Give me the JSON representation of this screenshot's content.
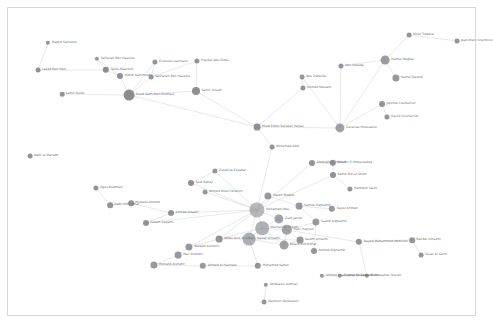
{
  "figure": {
    "kind": "network-graph",
    "title": "",
    "background": "#ffffff",
    "border_color": "#d8d8d8",
    "node_color": "#7d7f84",
    "edge_color": "#d5d5d7",
    "label_color": "#6d6f73"
  },
  "chart_data": {
    "type": "scatter",
    "title": "",
    "xlabel": "",
    "ylabel": "",
    "grid": false,
    "legend": "none",
    "layout": "force-directed",
    "node_count": 62,
    "edge_count": 75,
    "nodes": [
      {
        "id": "n0",
        "label": "Madjid Sahoune",
        "x": 48,
        "y": 43,
        "r": 2.2,
        "side": "r",
        "o": 0.82
      },
      {
        "id": "n1",
        "label": "Lased Ben Heni",
        "x": 38,
        "y": 70,
        "r": 2.4,
        "side": "r",
        "o": 0.85
      },
      {
        "id": "n2",
        "label": "Tarek Maaroufi",
        "x": 106,
        "y": 70,
        "r": 3.2,
        "side": "r",
        "o": 0.88
      },
      {
        "id": "n3",
        "label": "Seifallah Ben Hassine",
        "x": 97,
        "y": 59,
        "r": 2.2,
        "side": "r",
        "o": 0.8
      },
      {
        "id": "n4",
        "label": "Mehdi Kammoun",
        "x": 120,
        "y": 76,
        "r": 3.0,
        "side": "r",
        "o": 0.85
      },
      {
        "id": "n5",
        "label": "Samir Kishk",
        "x": 62,
        "y": 94,
        "r": 2.3,
        "side": "r",
        "o": 0.82
      },
      {
        "id": "n6",
        "label": "Essid Sami Ben Khemais",
        "x": 129,
        "y": 95,
        "r": 5.4,
        "side": "r",
        "o": 0.9
      },
      {
        "id": "n7",
        "label": "Essoussi Laaroussi",
        "x": 155,
        "y": 62,
        "r": 2.6,
        "side": "r",
        "o": 0.82
      },
      {
        "id": "n8",
        "label": "Sadfallah Ben Hassine",
        "x": 151,
        "y": 77,
        "r": 2.4,
        "side": "r",
        "o": 0.82
      },
      {
        "id": "n9",
        "label": "Haydar Abu Doha",
        "x": 197,
        "y": 61,
        "r": 2.6,
        "side": "r",
        "o": 0.84
      },
      {
        "id": "n10",
        "label": "Samir Yousef",
        "x": 196,
        "y": 91,
        "r": 4.0,
        "side": "r",
        "o": 0.86
      },
      {
        "id": "n11",
        "label": "Nabil al-Marabh",
        "x": 30,
        "y": 156,
        "r": 2.4,
        "side": "r",
        "o": 0.84
      },
      {
        "id": "n12",
        "label": "Imad Eddin Barakat Yarkas",
        "x": 257,
        "y": 127,
        "r": 3.4,
        "side": "r",
        "o": 0.86
      },
      {
        "id": "n13",
        "label": "Mohamed Abdi",
        "x": 272,
        "y": 147,
        "r": 2.4,
        "side": "r",
        "o": 0.82
      },
      {
        "id": "n14",
        "label": "Abdelghani Mzoudi",
        "x": 312,
        "y": 163,
        "r": 3.0,
        "side": "r",
        "o": 0.84
      },
      {
        "id": "n15",
        "label": "Mounir El Motassadeq",
        "x": 333,
        "y": 163,
        "r": 3.2,
        "side": "r",
        "o": 0.86
      },
      {
        "id": "n16",
        "label": "Ramzi Bin al-Shibh",
        "x": 333,
        "y": 175,
        "r": 3.0,
        "side": "r",
        "o": 0.85
      },
      {
        "id": "n17",
        "label": "Mamduh Salim",
        "x": 350,
        "y": 189,
        "r": 2.6,
        "side": "r",
        "o": 0.82
      },
      {
        "id": "n18",
        "label": "Agus Budiman",
        "x": 96,
        "y": 188,
        "r": 2.6,
        "side": "r",
        "o": 0.84
      },
      {
        "id": "n19",
        "label": "Said Bahaji",
        "x": 191,
        "y": 183,
        "r": 3.0,
        "side": "r",
        "o": 0.85
      },
      {
        "id": "n20",
        "label": "Zakariya Essabar",
        "x": 215,
        "y": 171,
        "r": 2.6,
        "side": "r",
        "o": 0.82
      },
      {
        "id": "n21",
        "label": "Ahmed Khalil Ibrahim",
        "x": 205,
        "y": 192,
        "r": 2.4,
        "side": "r",
        "o": 0.8
      },
      {
        "id": "n22",
        "label": "Nabil Almihdhar",
        "x": 110,
        "y": 205,
        "r": 2.8,
        "side": "r",
        "o": 0.84
      },
      {
        "id": "n23",
        "label": "Mustafa Ahmed",
        "x": 131,
        "y": 203,
        "r": 2.8,
        "side": "r",
        "o": 0.84
      },
      {
        "id": "n24",
        "label": "Ahmed Alnami",
        "x": 171,
        "y": 213,
        "r": 3.0,
        "side": "r",
        "o": 0.84
      },
      {
        "id": "n25",
        "label": "Satam Suqami",
        "x": 146,
        "y": 223,
        "r": 3.0,
        "side": "r",
        "o": 0.84
      },
      {
        "id": "n26",
        "label": "Mohamed Atta",
        "x": 257,
        "y": 210,
        "r": 7.6,
        "side": "r",
        "o": 0.55
      },
      {
        "id": "n27",
        "label": "Marwan Al-Shehhi",
        "x": 262,
        "y": 228,
        "r": 6.8,
        "side": "r",
        "o": 0.6
      },
      {
        "id": "n28",
        "label": "Ziad Jarrah",
        "x": 279,
        "y": 219,
        "r": 4.6,
        "side": "r",
        "o": 0.72
      },
      {
        "id": "n29",
        "label": "Hani Hanjour",
        "x": 287,
        "y": 230,
        "r": 5.2,
        "side": "r",
        "o": 0.7
      },
      {
        "id": "n30",
        "label": "Nawaf Alhazmi",
        "x": 249,
        "y": 239,
        "r": 6.4,
        "side": "r",
        "o": 0.62
      },
      {
        "id": "n31",
        "label": "Khalid Almihdhar",
        "x": 284,
        "y": 245,
        "r": 4.4,
        "side": "r",
        "o": 0.72
      },
      {
        "id": "n32",
        "label": "Salem Alhazmi",
        "x": 300,
        "y": 240,
        "r": 3.4,
        "side": "r",
        "o": 0.8
      },
      {
        "id": "n33",
        "label": "Majed Moqed",
        "x": 268,
        "y": 196,
        "r": 3.6,
        "side": "r",
        "o": 0.78
      },
      {
        "id": "n34",
        "label": "Abdul Aziz Al-Omari",
        "x": 219,
        "y": 239,
        "r": 3.4,
        "side": "r",
        "o": 0.82
      },
      {
        "id": "n35",
        "label": "Waleed Alshehri",
        "x": 189,
        "y": 247,
        "r": 3.6,
        "side": "r",
        "o": 0.8
      },
      {
        "id": "n36",
        "label": "Wail Alshehri",
        "x": 178,
        "y": 255,
        "r": 3.4,
        "side": "r",
        "o": 0.8
      },
      {
        "id": "n37",
        "label": "Mohand Alshehri",
        "x": 154,
        "y": 265,
        "r": 3.6,
        "side": "r",
        "o": 0.78
      },
      {
        "id": "n38",
        "label": "Ahmed Al Haznawi",
        "x": 203,
        "y": 266,
        "r": 3.2,
        "side": "r",
        "o": 0.8
      },
      {
        "id": "n39",
        "label": "Mohamed Kamel",
        "x": 258,
        "y": 266,
        "r": 3.2,
        "side": "r",
        "o": 0.82
      },
      {
        "id": "n40",
        "label": "Ahmed Alghamdi",
        "x": 314,
        "y": 251,
        "r": 3.0,
        "side": "r",
        "o": 0.82
      },
      {
        "id": "n41",
        "label": "Saeed Alghamdi",
        "x": 316,
        "y": 222,
        "r": 3.6,
        "side": "r",
        "o": 0.78
      },
      {
        "id": "n42",
        "label": "Hamza Alghamdi",
        "x": 299,
        "y": 206,
        "r": 3.4,
        "side": "r",
        "o": 0.8
      },
      {
        "id": "n43",
        "label": "Fayez Ahmed",
        "x": 332,
        "y": 209,
        "r": 3.2,
        "side": "r",
        "o": 0.8
      },
      {
        "id": "n44",
        "label": "Rayed Mohammed Abdullah",
        "x": 359,
        "y": 242,
        "r": 3.2,
        "side": "r",
        "o": 0.82
      },
      {
        "id": "n45",
        "label": "Bandar Alhazmi",
        "x": 412,
        "y": 240,
        "r": 2.8,
        "side": "r",
        "o": 0.82
      },
      {
        "id": "n46",
        "label": "Faisal Al Salmi",
        "x": 421,
        "y": 255,
        "r": 2.4,
        "side": "r",
        "o": 0.82
      },
      {
        "id": "n47",
        "label": "Abdussattar Shaikh",
        "x": 367,
        "y": 276,
        "r": 2.2,
        "side": "r",
        "o": 0.8
      },
      {
        "id": "n48",
        "label": "Osama Awadallah",
        "x": 340,
        "y": 276,
        "r": 2.2,
        "side": "r",
        "o": 0.8
      },
      {
        "id": "n49",
        "label": "Abdelaziz Alomari",
        "x": 266,
        "y": 285,
        "r": 2.2,
        "side": "r",
        "o": 0.8
      },
      {
        "id": "n50",
        "label": "Mamoun Darkazanli",
        "x": 264,
        "y": 302,
        "r": 2.4,
        "side": "r",
        "o": 0.82
      },
      {
        "id": "n51",
        "label": "Zacarias Moussaoui",
        "x": 340,
        "y": 128,
        "r": 4.6,
        "side": "r",
        "o": 0.72
      },
      {
        "id": "n52",
        "label": "Abu Qatada",
        "x": 341,
        "y": 66,
        "r": 2.6,
        "side": "r",
        "o": 0.82
      },
      {
        "id": "n53",
        "label": "Djamal Beghal",
        "x": 385,
        "y": 60,
        "r": 4.4,
        "side": "r",
        "o": 0.76
      },
      {
        "id": "n54",
        "label": "Kamel Daoudi",
        "x": 396,
        "y": 78,
        "r": 3.6,
        "side": "r",
        "o": 0.8
      },
      {
        "id": "n55",
        "label": "Jerome Courtaillier",
        "x": 382,
        "y": 104,
        "r": 3.0,
        "side": "r",
        "o": 0.82
      },
      {
        "id": "n56",
        "label": "David Courtaillier",
        "x": 387,
        "y": 117,
        "r": 2.6,
        "side": "r",
        "o": 0.82
      },
      {
        "id": "n57",
        "label": "Nizar Trabelsi",
        "x": 409,
        "y": 35,
        "r": 2.4,
        "side": "r",
        "o": 0.82
      },
      {
        "id": "n58",
        "label": "Jean-Marc Grandvisir",
        "x": 457,
        "y": 41,
        "r": 2.4,
        "side": "r",
        "o": 0.82
      },
      {
        "id": "n59",
        "label": "Ahmed Ressam",
        "x": 303,
        "y": 88,
        "r": 2.6,
        "side": "r",
        "o": 0.82
      },
      {
        "id": "n60",
        "label": "Abu Zubeida",
        "x": 302,
        "y": 77,
        "r": 2.4,
        "side": "r",
        "o": 0.8
      },
      {
        "id": "n61",
        "label": "Ahmed Khalil Ibrahim Samir Al-Ani",
        "x": 322,
        "y": 276,
        "r": 2.2,
        "side": "r",
        "o": 0.8
      }
    ],
    "edges": [
      [
        "n0",
        "n1"
      ],
      [
        "n1",
        "n2"
      ],
      [
        "n2",
        "n3"
      ],
      [
        "n2",
        "n4"
      ],
      [
        "n3",
        "n4"
      ],
      [
        "n4",
        "n6"
      ],
      [
        "n5",
        "n6"
      ],
      [
        "n6",
        "n7"
      ],
      [
        "n6",
        "n8"
      ],
      [
        "n6",
        "n10"
      ],
      [
        "n7",
        "n8"
      ],
      [
        "n8",
        "n9"
      ],
      [
        "n9",
        "n10"
      ],
      [
        "n6",
        "n12"
      ],
      [
        "n10",
        "n12"
      ],
      [
        "n12",
        "n13"
      ],
      [
        "n12",
        "n51"
      ],
      [
        "n13",
        "n26"
      ],
      [
        "n14",
        "n15"
      ],
      [
        "n15",
        "n16"
      ],
      [
        "n16",
        "n17"
      ],
      [
        "n16",
        "n26"
      ],
      [
        "n14",
        "n26"
      ],
      [
        "n19",
        "n20"
      ],
      [
        "n19",
        "n26"
      ],
      [
        "n20",
        "n26"
      ],
      [
        "n21",
        "n26"
      ],
      [
        "n18",
        "n22"
      ],
      [
        "n22",
        "n23"
      ],
      [
        "n23",
        "n24"
      ],
      [
        "n24",
        "n26"
      ],
      [
        "n25",
        "n26"
      ],
      [
        "n24",
        "n25"
      ],
      [
        "n26",
        "n27"
      ],
      [
        "n26",
        "n28"
      ],
      [
        "n26",
        "n30"
      ],
      [
        "n26",
        "n33"
      ],
      [
        "n26",
        "n34"
      ],
      [
        "n27",
        "n28"
      ],
      [
        "n27",
        "n29"
      ],
      [
        "n27",
        "n30"
      ],
      [
        "n27",
        "n31"
      ],
      [
        "n28",
        "n29"
      ],
      [
        "n29",
        "n31"
      ],
      [
        "n29",
        "n32"
      ],
      [
        "n30",
        "n31"
      ],
      [
        "n30",
        "n32"
      ],
      [
        "n31",
        "n32"
      ],
      [
        "n33",
        "n42"
      ],
      [
        "n34",
        "n35"
      ],
      [
        "n35",
        "n36"
      ],
      [
        "n36",
        "n37"
      ],
      [
        "n35",
        "n26"
      ],
      [
        "n37",
        "n38"
      ],
      [
        "n38",
        "n39"
      ],
      [
        "n39",
        "n30"
      ],
      [
        "n40",
        "n41"
      ],
      [
        "n41",
        "n42"
      ],
      [
        "n42",
        "n43"
      ],
      [
        "n41",
        "n29"
      ],
      [
        "n29",
        "n44"
      ],
      [
        "n44",
        "n45"
      ],
      [
        "n45",
        "n46"
      ],
      [
        "n44",
        "n47"
      ],
      [
        "n47",
        "n48"
      ],
      [
        "n48",
        "n61"
      ],
      [
        "n49",
        "n50"
      ],
      [
        "n51",
        "n53"
      ],
      [
        "n51",
        "n55"
      ],
      [
        "n52",
        "n53"
      ],
      [
        "n53",
        "n54"
      ],
      [
        "n53",
        "n57"
      ],
      [
        "n57",
        "n58"
      ],
      [
        "n55",
        "n56"
      ],
      [
        "n59",
        "n60"
      ],
      [
        "n60",
        "n51"
      ],
      [
        "n52",
        "n51"
      ],
      [
        "n12",
        "n59"
      ],
      [
        "n27",
        "n34"
      ],
      [
        "n30",
        "n34"
      ]
    ]
  }
}
